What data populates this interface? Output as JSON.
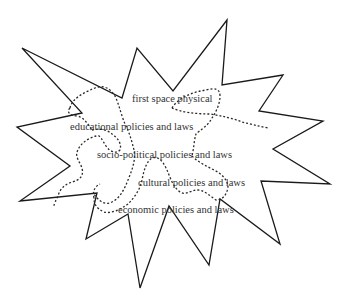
{
  "diagram": {
    "type": "star-burst-with-overlapping-dotted-regions",
    "colors": {
      "background": "#ffffff",
      "outline": "#1a1a1a",
      "text": "#333333"
    },
    "labels": [
      {
        "id": "first-space",
        "text": "first space physical"
      },
      {
        "id": "educational",
        "text": "educational policies and laws"
      },
      {
        "id": "socio-political",
        "text": "socio-political policies and laws"
      },
      {
        "id": "cultural",
        "text": "cultural policies and laws"
      },
      {
        "id": "economic",
        "text": "economic policies and laws"
      }
    ],
    "shapes": {
      "outer_star": "solid outline 16-point jagged star",
      "inner_regions": "dotted irregular outlines overlapping the labels"
    }
  }
}
